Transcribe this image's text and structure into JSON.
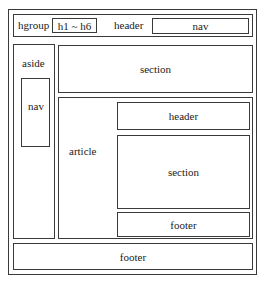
{
  "diagram": {
    "type": "html5-semantic-layout",
    "page_header": {
      "label": "header",
      "hgroup": {
        "label": "hgroup",
        "inner": "h1 ~ h6"
      },
      "nav": {
        "label": "nav"
      }
    },
    "aside": {
      "label": "aside",
      "nav": {
        "label": "nav"
      }
    },
    "section": {
      "label": "section"
    },
    "article": {
      "label": "article",
      "header": {
        "label": "header"
      },
      "section": {
        "label": "section"
      },
      "footer": {
        "label": "footer"
      }
    },
    "page_footer": {
      "label": "footer"
    },
    "colors": {
      "line": "#3a3a3a",
      "background": "#ffffff",
      "text": "#222222"
    }
  }
}
